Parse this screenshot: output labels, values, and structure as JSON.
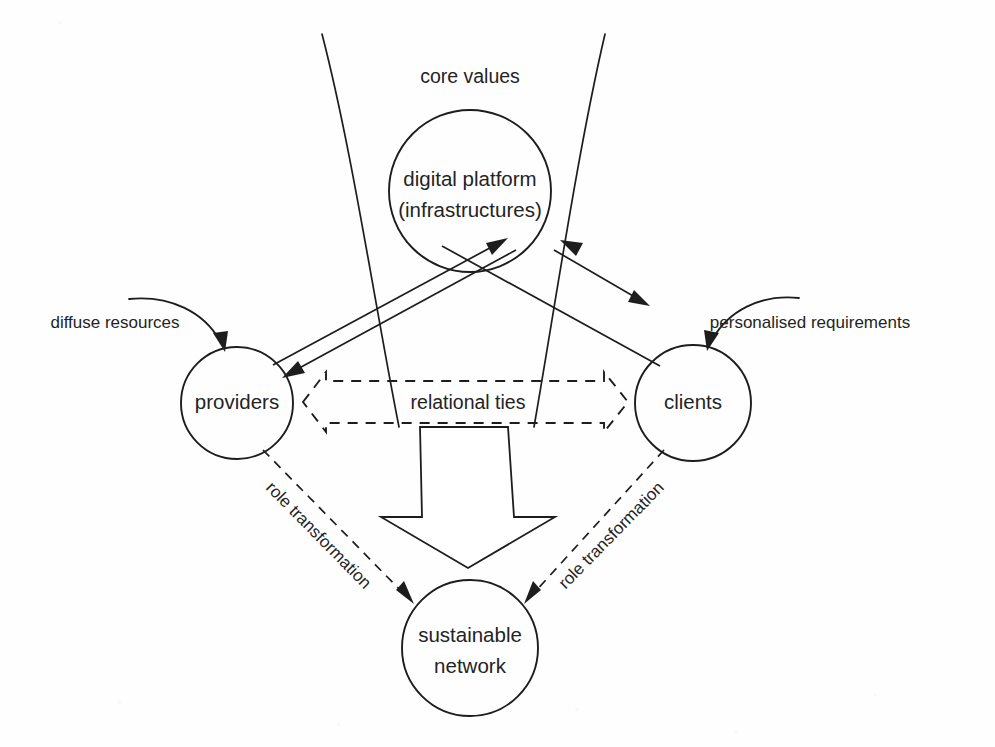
{
  "diagram": {
    "background_color": "#fefefe",
    "stroke_color": "#1d1d1d",
    "text_color": "#242424",
    "nodes": [
      {
        "id": "digital-platform",
        "lines": [
          "digital platform",
          "(infrastructures)"
        ],
        "line1": "digital platform",
        "line2": "(infrastructures)",
        "cx": 470,
        "cy": 191,
        "r": 81
      },
      {
        "id": "providers",
        "lines": [
          "providers"
        ],
        "line1": "providers",
        "cx": 237,
        "cy": 403,
        "r": 56
      },
      {
        "id": "clients",
        "lines": [
          "clients"
        ],
        "line1": "clients",
        "cx": 693,
        "cy": 403,
        "r": 58
      },
      {
        "id": "sustainable-network",
        "lines": [
          "sustainable",
          "network"
        ],
        "line1": "sustainable",
        "line2": "network",
        "cx": 470,
        "cy": 648,
        "r": 68
      }
    ],
    "labels": {
      "core_values": "core values",
      "relational_ties": "relational ties",
      "diffuse_resources": "diffuse resources",
      "personalised_requirements": "personalised requirements",
      "role_transformation_left": "role transformation",
      "role_transformation_right": "role transformation"
    },
    "edges": [
      {
        "id": "providers-to-platform",
        "from": "providers",
        "to": "digital-platform",
        "style": "solid-arrow",
        "direction": "up-right"
      },
      {
        "id": "platform-to-providers",
        "from": "digital-platform",
        "to": "providers",
        "style": "solid-arrow",
        "direction": "down-left"
      },
      {
        "id": "clients-to-platform",
        "from": "clients",
        "to": "digital-platform",
        "style": "solid-arrow",
        "direction": "up-left"
      },
      {
        "id": "platform-to-clients",
        "from": "digital-platform",
        "to": "clients",
        "style": "solid-arrow",
        "direction": "down-right"
      },
      {
        "id": "diffuse-resources-inflow",
        "from": "external",
        "to": "providers",
        "style": "curved-arrow",
        "label": "diffuse resources"
      },
      {
        "id": "personalised-requirements-inflow",
        "from": "external",
        "to": "clients",
        "style": "curved-arrow",
        "label": "personalised requirements"
      },
      {
        "id": "relational-ties-band",
        "from": "providers",
        "to": "clients",
        "style": "dashed-double-block-arrow",
        "label": "relational ties"
      },
      {
        "id": "core-values-funnel",
        "from": "core values",
        "to": "sustainable-network",
        "style": "hollow-block-arrow"
      },
      {
        "id": "providers-role-transformation",
        "from": "providers",
        "to": "sustainable-network",
        "style": "dashed-arrow",
        "label": "role transformation"
      },
      {
        "id": "clients-role-transformation",
        "from": "clients",
        "to": "sustainable-network",
        "style": "dashed-arrow",
        "label": "role transformation"
      }
    ]
  }
}
